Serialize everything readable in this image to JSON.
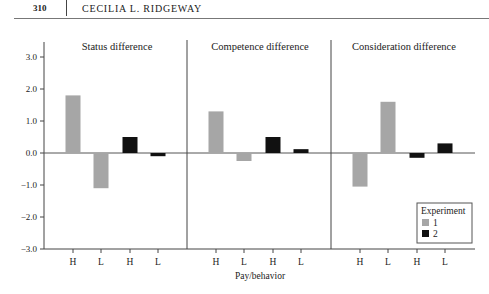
{
  "header": {
    "page_number": "310",
    "running_head": "CECILIA L. RIDGEWAY"
  },
  "chart_data": {
    "type": "bar",
    "title": "",
    "xlabel": "Pay/behavior",
    "ylabel": "",
    "ylim": [
      -3.0,
      3.0
    ],
    "yticks": [
      "3.0",
      "2.0",
      "1.0",
      "0.0",
      "−1.0",
      "−2.0",
      "−3.0"
    ],
    "grid": false,
    "legend": {
      "title": "Experiment",
      "position": "lower right",
      "entries": [
        "1",
        "2"
      ]
    },
    "colors": {
      "1": "#a6a6a6",
      "2": "#111111"
    },
    "panels": [
      {
        "title": "Status difference",
        "categories": [
          "H",
          "L",
          "H",
          "L"
        ],
        "experiment": [
          "1",
          "1",
          "2",
          "2"
        ],
        "values": [
          1.8,
          -1.1,
          0.5,
          -0.1
        ]
      },
      {
        "title": "Competence difference",
        "categories": [
          "H",
          "L",
          "H",
          "L"
        ],
        "experiment": [
          "1",
          "1",
          "2",
          "2"
        ],
        "values": [
          1.3,
          -0.25,
          0.5,
          0.12
        ]
      },
      {
        "title": "Consideration difference",
        "categories": [
          "H",
          "L",
          "H",
          "L"
        ],
        "experiment": [
          "1",
          "1",
          "2",
          "2"
        ],
        "values": [
          -1.05,
          1.6,
          -0.15,
          0.3
        ]
      }
    ]
  }
}
